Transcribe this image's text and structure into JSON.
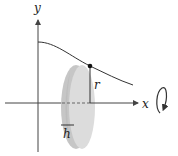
{
  "diagram": {
    "type": "disk-method-solid-of-revolution",
    "labels": {
      "y_axis": "y",
      "x_axis": "x",
      "radius": "r",
      "thickness": "h"
    },
    "colors": {
      "axis": "#444444",
      "curve": "#333333",
      "disk_face": "#d9d9d9",
      "disk_rim": "#c4c4c4",
      "disk_shadow": "#bdbdbd",
      "point": "#111111",
      "background": "#ffffff"
    },
    "elements": [
      "y-axis with arrow",
      "x-axis with arrow",
      "decreasing curve f(x)",
      "disk (cylinder slice) of radius r and thickness h",
      "point on curve at top of disk",
      "rotation arrow about x-axis"
    ]
  }
}
